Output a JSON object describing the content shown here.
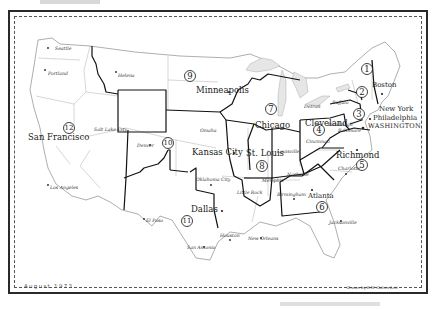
{
  "map": {
    "title": "Federal Regions of the United States",
    "date": "August 1973",
    "credit": "Drawn by R.W. Galvin Lett",
    "regions": [
      {
        "number": "1",
        "hq": "Boston"
      },
      {
        "number": "2",
        "hq": "New York"
      },
      {
        "number": "3",
        "hq": "Philadelphia"
      },
      {
        "number": "4",
        "hq": "Atlanta"
      },
      {
        "number": "5",
        "hq": "Chicago"
      },
      {
        "number": "6",
        "hq": "Dallas"
      },
      {
        "number": "7",
        "hq": "Kansas City"
      },
      {
        "number": "8",
        "hq": "Denver"
      },
      {
        "number": "9",
        "hq": "San Francisco"
      },
      {
        "number": "10",
        "hq": "Seattle"
      }
    ],
    "district_numbers": [
      "1",
      "2",
      "3",
      "4",
      "5",
      "6",
      "7",
      "8",
      "9",
      "10",
      "11",
      "12"
    ],
    "major_cities": {
      "boston": "Boston",
      "new_york": "New York",
      "philadelphia": "Philadelphia",
      "washington": "WASHINGTON",
      "cleveland": "Cleveland",
      "richmond": "Richmond",
      "atlanta": "Atlanta",
      "chicago": "Chicago",
      "st_louis": "St. Louis",
      "minneapolis": "Minneapolis",
      "kansas_city": "Kansas City",
      "dallas": "Dallas",
      "san_francisco": "San Francisco"
    },
    "minor_cities": {
      "seattle": "Seattle",
      "portland": "Portland",
      "helena": "Helena",
      "salt_lake_city": "Salt Lake City",
      "denver": "Denver",
      "omaha": "Omaha",
      "los_angeles": "Los Angeles",
      "el_paso": "El Paso",
      "oklahoma_city": "Oklahoma City",
      "san_antonio": "San Antonio",
      "houston": "Houston",
      "new_orleans": "New Orleans",
      "little_rock": "Little Rock",
      "memphis": "Memphis",
      "nashville": "Nashville",
      "louisville": "Louisville",
      "birmingham": "Birmingham",
      "jacksonville": "Jacksonville",
      "charlotte": "Charlotte",
      "baltimore": "Baltimore",
      "cincinnati": "Cincinnati",
      "pittsburgh": "Pittsburgh",
      "detroit": "Detroit",
      "buffalo": "Buffalo"
    },
    "colors": {
      "ink": "#1a1a1a",
      "boundary": "#111111",
      "state_line": "#888888",
      "lake_fill": "#e6e6e6",
      "paper": "#ffffff"
    }
  }
}
